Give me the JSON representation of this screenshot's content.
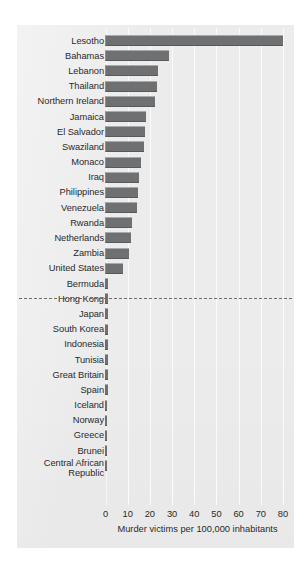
{
  "chart_data": {
    "type": "bar",
    "orientation": "horizontal",
    "title": "",
    "subtitle": "",
    "xlabel": "Murder victims per 100,000 inhabitants",
    "ylabel": "",
    "xlim": [
      0,
      80
    ],
    "xticks": [
      0,
      10,
      20,
      30,
      40,
      50,
      60,
      70,
      80
    ],
    "xtick_labels": [
      "0",
      "10",
      "20",
      "30",
      "40",
      "50",
      "60",
      "70",
      "80"
    ],
    "grid": true,
    "legend": null,
    "annotations": [
      {
        "type": "dashed-separator",
        "after_category": "United States",
        "note": "Dashed horizontal rule separating the highest-rate countries from the lowest-rate countries"
      }
    ],
    "categories": [
      "Lesotho",
      "Bahamas",
      "Lebanon",
      "Thailand",
      "Northern Ireland",
      "Jamaica",
      "El Salvador",
      "Swaziland",
      "Monaco",
      "Iraq",
      "Philippines",
      "Venezuela",
      "Rwanda",
      "Netherlands",
      "Zambia",
      "United States",
      "Bermuda",
      "Hong Kong",
      "Japan",
      "South Korea",
      "Indonesia",
      "Tunisia",
      "Great Britain",
      "Spain",
      "Iceland",
      "Norway",
      "Greece",
      "Brunei",
      "Central African\nRepublic"
    ],
    "values": [
      80.0,
      29.0,
      24.0,
      23.5,
      22.5,
      18.5,
      18.0,
      17.5,
      16.0,
      15.5,
      15.0,
      14.5,
      12.0,
      11.5,
      11.0,
      8.0,
      1.5,
      1.5,
      1.4,
      1.4,
      1.3,
      1.3,
      1.2,
      1.2,
      1.1,
      1.1,
      1.0,
      1.0,
      1.0
    ],
    "series": [
      {
        "name": "Murder victims per 100,000 inhabitants",
        "color": "#6f7072",
        "values": [
          80.0,
          29.0,
          24.0,
          23.5,
          22.5,
          18.5,
          18.0,
          17.5,
          16.0,
          15.5,
          15.0,
          14.5,
          12.0,
          11.5,
          11.0,
          8.0,
          1.5,
          1.5,
          1.4,
          1.4,
          1.3,
          1.3,
          1.2,
          1.2,
          1.1,
          1.1,
          1.0,
          1.0,
          1.0
        ]
      }
    ]
  },
  "style": {
    "panel_background": "#ececed",
    "bar_color": "#6f7072",
    "bar_highlight": "#a9aaac",
    "bar_shadow": "#58595b",
    "gridline_color": "#fbfbfb",
    "text_color": "#2a2a2a",
    "separator_color": "#6a6b6d"
  }
}
